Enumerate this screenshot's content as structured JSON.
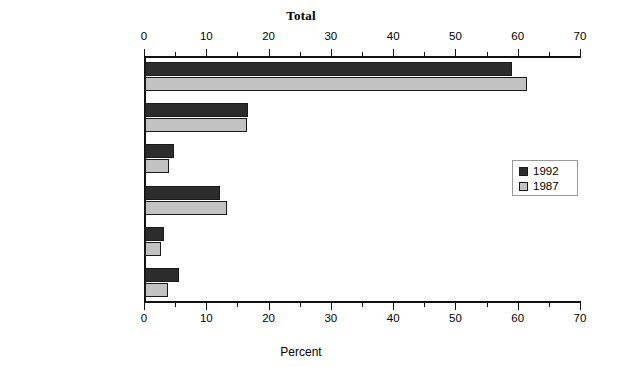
{
  "chart_data": {
    "type": "bar",
    "orientation": "horizontal",
    "title": "Total",
    "xlabel": "Percent",
    "ylabel": "",
    "xlim": [
      0,
      70
    ],
    "xticks": [
      0,
      10,
      20,
      30,
      40,
      50,
      60,
      70
    ],
    "xtick_labels": [
      "0",
      "10",
      "20",
      "30",
      "40",
      "50",
      "60",
      "70"
    ],
    "minor_tick_step": 5,
    "grid": false,
    "top_axis": true,
    "bottom_axis": true,
    "legend_position": "middle-right",
    "categories": [
      "Teaching",
      "Research/scholarship",
      "Professional growth",
      "Administration",
      "Outside consulting/\nfreelance work",
      "Service\nand other"
    ],
    "category_lines": [
      [
        "Teaching"
      ],
      [
        "Research/scholarship"
      ],
      [
        "Professional growth"
      ],
      [
        "Administration"
      ],
      [
        "Outside consulting/",
        "freelance work"
      ],
      [
        "Service",
        "and other"
      ]
    ],
    "series": [
      {
        "name": "1992",
        "color": "#2c2c2c",
        "values": [
          59.0,
          16.5,
          4.7,
          12.0,
          3.0,
          5.5
        ]
      },
      {
        "name": "1987",
        "color": "#c2c2c2",
        "values": [
          61.3,
          16.3,
          3.9,
          13.2,
          2.6,
          3.7
        ]
      }
    ]
  },
  "legend": {
    "items": [
      {
        "label": "1992",
        "color": "#2c2c2c"
      },
      {
        "label": "1987",
        "color": "#c2c2c2"
      }
    ]
  },
  "colors": {
    "series_1992": "#2c2c2c",
    "series_1987": "#c2c2c2",
    "axis": "#111111",
    "background": "#ffffff"
  }
}
